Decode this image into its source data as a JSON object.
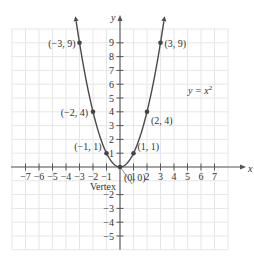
{
  "chart_data": {
    "type": "line",
    "title": "",
    "equation_label": "y = x",
    "equation_exponent": "2",
    "xlabel": "x",
    "ylabel": "y",
    "xlim": [
      -8,
      8
    ],
    "ylim": [
      -6,
      10
    ],
    "grid": true,
    "x_ticks": [
      -7,
      -6,
      -5,
      -4,
      -3,
      -2,
      -1,
      1,
      2,
      3,
      4,
      5,
      6,
      7
    ],
    "x_tick_labels": [
      "−7",
      "−6",
      "−5",
      "−4",
      "−3",
      "−2",
      "−1",
      "1",
      "2",
      "3",
      "4",
      "5",
      "6",
      "7"
    ],
    "y_ticks": [
      -5,
      -4,
      -3,
      -2,
      1,
      2,
      3,
      4,
      5,
      6,
      7,
      8,
      9
    ],
    "y_tick_labels": [
      "−5",
      "−4",
      "−3",
      "−2",
      "1",
      "2",
      "3",
      "4",
      "5",
      "6",
      "7",
      "8",
      "9"
    ],
    "series": [
      {
        "name": "y = x^2",
        "function": "x^2",
        "x_range": [
          -3.25,
          3.25
        ],
        "color": "#444444"
      }
    ],
    "points": [
      {
        "x": -3,
        "y": 9,
        "label": "(−3, 9)"
      },
      {
        "x": -2,
        "y": 4,
        "label": "(−2, 4)"
      },
      {
        "x": -1,
        "y": 1,
        "label": "(−1, 1)"
      },
      {
        "x": 0,
        "y": 0,
        "label": "(0, 0)"
      },
      {
        "x": 1,
        "y": 1,
        "label": "(1, 1)"
      },
      {
        "x": 2,
        "y": 4,
        "label": "(2, 4)"
      },
      {
        "x": 3,
        "y": 9,
        "label": "(3, 9)"
      }
    ],
    "annotations": [
      {
        "text": "Vertex",
        "target": {
          "x": 0,
          "y": 0
        }
      }
    ]
  },
  "colors": {
    "grid": "#e6e6e6",
    "axis": "#555555",
    "curve": "#4a4a4a",
    "point": "#444444",
    "text": "#333333"
  }
}
